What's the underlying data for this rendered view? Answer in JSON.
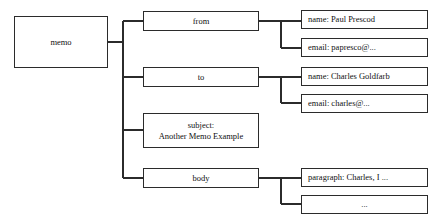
{
  "diagram": {
    "type": "tree",
    "style": {
      "background": "#ffffff",
      "box_fill": "#ffffff",
      "box_border": "#2b2b2b",
      "line_color": "#2b2b2b",
      "text_color": "#111111"
    },
    "nodes": {
      "root": {
        "label": "memo",
        "align": "center"
      },
      "from": {
        "label": "from",
        "align": "center"
      },
      "from_name": {
        "label": "name:  Paul Prescod",
        "align": "left"
      },
      "from_email": {
        "label": "email: papresco@...",
        "align": "left"
      },
      "to": {
        "label": "to",
        "align": "center"
      },
      "to_name": {
        "label": "name: Charles Goldfarb",
        "align": "left"
      },
      "to_email": {
        "label": "email:  charles@...",
        "align": "left"
      },
      "subject": {
        "label": "subject:\nAnother Memo Example",
        "align": "center"
      },
      "body": {
        "label": "body",
        "align": "center"
      },
      "body_paragraph": {
        "label": "paragraph: Charles, I ...",
        "align": "left"
      },
      "body_more": {
        "label": "...",
        "align": "center"
      }
    },
    "edges": [
      {
        "from": "memo",
        "to": "from"
      },
      {
        "from": "memo",
        "to": "to"
      },
      {
        "from": "memo",
        "to": "subject"
      },
      {
        "from": "memo",
        "to": "body"
      },
      {
        "from": "from",
        "to": "from_name"
      },
      {
        "from": "from",
        "to": "from_email"
      },
      {
        "from": "to",
        "to": "to_name"
      },
      {
        "from": "to",
        "to": "to_email"
      },
      {
        "from": "body",
        "to": "body_paragraph"
      },
      {
        "from": "body",
        "to": "body_more"
      }
    ]
  }
}
